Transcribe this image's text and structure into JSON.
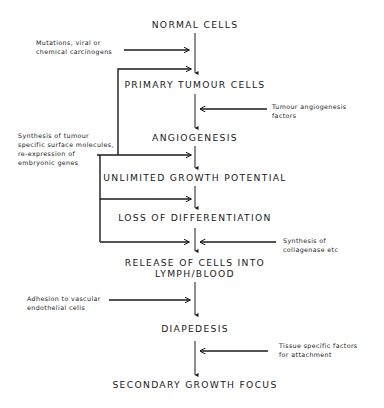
{
  "diagram": {
    "type": "flowchart",
    "steps": [
      {
        "id": "normal",
        "label": "NORMAL CELLS"
      },
      {
        "id": "primary",
        "label": "PRIMARY TUMOUR CELLS"
      },
      {
        "id": "angiogenesis",
        "label": "ANGIOGENESIS"
      },
      {
        "id": "unlimited",
        "label": "UNLIMITED GROWTH POTENTIAL"
      },
      {
        "id": "loss",
        "label": "LOSS OF DIFFERENTIATION"
      },
      {
        "id": "release",
        "label_line1": "RELEASE OF CELLS INTO",
        "label_line2": "LYMPH/BLOOD"
      },
      {
        "id": "diapedesis",
        "label": "DIAPEDESIS"
      },
      {
        "id": "secondary",
        "label": "SECONDARY GROWTH FOCUS"
      }
    ],
    "factors": {
      "mutations": {
        "line1": "Mutations, viral or",
        "line2": "chemical carcinogens",
        "side": "left",
        "target": "normal->primary"
      },
      "angiogenesis_factors": {
        "line1": "Tumour angiogenesis",
        "line2": "factors",
        "side": "right",
        "target": "primary->angiogenesis"
      },
      "synthesis_surface": {
        "line1": "Synthesis of tumour",
        "line2": "specific surface molecules,",
        "line3": "re-expression of",
        "line4": "embryonic genes",
        "side": "left",
        "targets": [
          "primary",
          "unlimited",
          "loss",
          "release"
        ]
      },
      "collagenase": {
        "line1": "Synthesis of",
        "line2": "collagenase etc",
        "side": "right",
        "target": "loss->release"
      },
      "adhesion": {
        "line1": "Adhesion to vascular",
        "line2": "endothelial cells",
        "side": "left",
        "target": "release->diapedesis"
      },
      "tissue_factors": {
        "line1": "Tissue specific factors",
        "line2": "for attachment",
        "side": "right",
        "target": "diapedesis->secondary"
      }
    },
    "colors": {
      "ink": "#1a1a1a",
      "background": "#ffffff"
    }
  }
}
